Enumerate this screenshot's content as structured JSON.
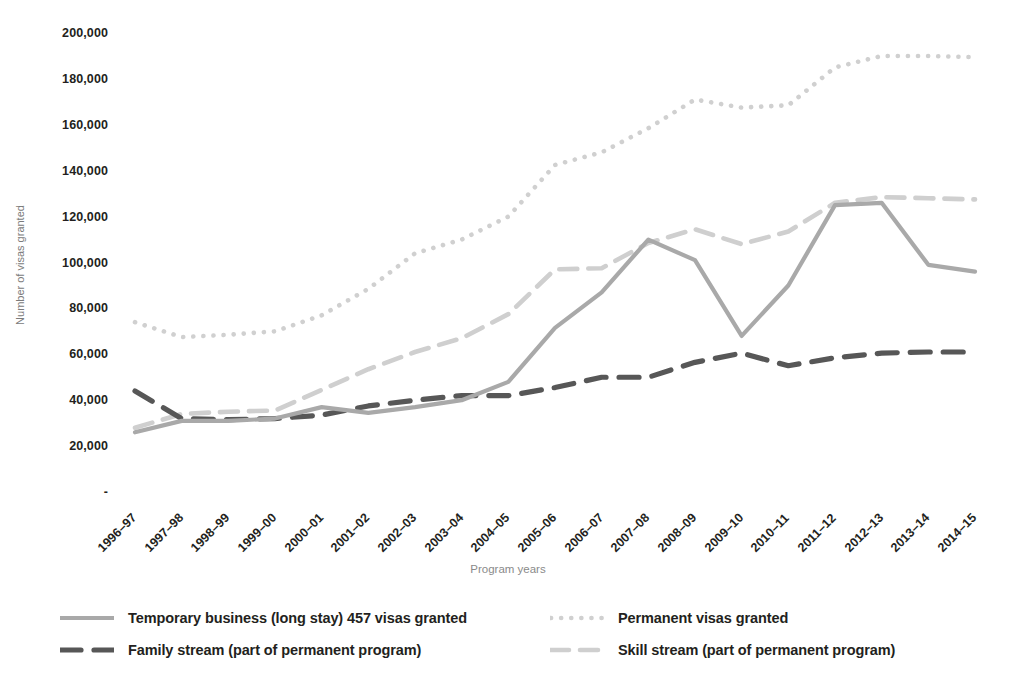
{
  "chart_data": {
    "type": "line",
    "title": "",
    "xlabel": "Program years",
    "ylabel": "Number of visas granted",
    "ylim": [
      0,
      200000
    ],
    "ytick_values": [
      0,
      20000,
      40000,
      60000,
      80000,
      100000,
      120000,
      140000,
      160000,
      180000,
      200000
    ],
    "ytick_labels": [
      "-",
      "20,000",
      "40,000",
      "60,000",
      "80,000",
      "100,000",
      "120,000",
      "140,000",
      "160,000",
      "180,000",
      "200,000"
    ],
    "grid": false,
    "legend_position": "bottom",
    "categories": [
      "1996–97",
      "1997–98",
      "1998–99",
      "1999–00",
      "2000–01",
      "2001–02",
      "2002–03",
      "2003–04",
      "2004–05",
      "2005–06",
      "2006–07",
      "2007–08",
      "2008–09",
      "2009–10",
      "2010–11",
      "2011–12",
      "2012–13",
      "2013–14",
      "2014–15"
    ],
    "series": [
      {
        "name": "Temporary business (long stay) 457 visas granted",
        "style": "solid",
        "color": "#a9a9a9",
        "values": [
          26000,
          31000,
          31000,
          32000,
          37000,
          34500,
          37000,
          40000,
          48000,
          71500,
          87000,
          110000,
          101000,
          68000,
          90000,
          125000,
          126000,
          99000,
          96000
        ]
      },
      {
        "name": "Permanent visas granted",
        "style": "dotted",
        "color": "#d0d0d0",
        "values": [
          74000,
          67500,
          68500,
          70000,
          77000,
          88500,
          104000,
          110000,
          120000,
          142500,
          148000,
          158500,
          171000,
          167500,
          168500,
          185000,
          190000,
          190000,
          189500
        ]
      },
      {
        "name": "Family stream (part of permanent program)",
        "style": "dashed-heavy",
        "color": "#575757",
        "values": [
          44000,
          32000,
          31500,
          32000,
          33500,
          37500,
          40000,
          42000,
          42000,
          45500,
          50000,
          50000,
          56500,
          60500,
          55000,
          58500,
          60500,
          61000,
          61000
        ]
      },
      {
        "name": "Skill stream (part of permanent program)",
        "style": "dashed-light",
        "color": "#cfcfcf",
        "values": [
          28000,
          34000,
          35000,
          35500,
          44500,
          53500,
          61000,
          67000,
          77500,
          97000,
          97500,
          108500,
          114500,
          108000,
          113500,
          126000,
          128500,
          128000,
          127500
        ]
      }
    ]
  },
  "axes": {
    "y_title": "Number of visas granted",
    "x_title": "Program years"
  },
  "legend": {
    "entries": [
      {
        "label": "Temporary business (long stay) 457 visas granted",
        "style": "solid",
        "color": "#a9a9a9"
      },
      {
        "label": "Permanent visas granted",
        "style": "dotted",
        "color": "#d0d0d0"
      },
      {
        "label": "Family stream (part of permanent program)",
        "style": "dashed-heavy",
        "color": "#575757"
      },
      {
        "label": "Skill stream (part of permanent program)",
        "style": "dashed-light",
        "color": "#cfcfcf"
      }
    ]
  },
  "colors": {
    "temporary": "#a9a9a9",
    "permanent": "#d0d0d0",
    "family": "#575757",
    "skill": "#cfcfcf",
    "axis_text": "#231f20",
    "axis_title": "#8a8a8a",
    "background": "#ffffff"
  }
}
